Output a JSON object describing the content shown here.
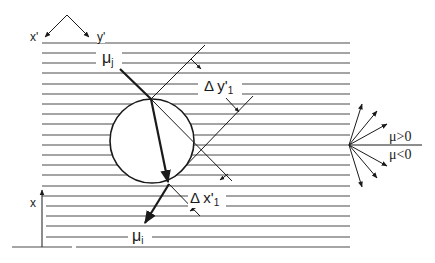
{
  "diagram": {
    "labels": {
      "axis_x_prime": "x'",
      "axis_y_prime": "y'",
      "axis_x": "x",
      "mu_j_main": "μ",
      "mu_j_sub": "j",
      "mu_i_main": "μ",
      "mu_i_sub": "i",
      "delta_y_main": "Δ y'",
      "delta_y_sub": "1",
      "delta_x_main": "Δ x'",
      "delta_x_sub": "1",
      "mu_positive": "μ>0",
      "mu_negative": "μ<0"
    },
    "colors": {
      "line": "#1a1a1a",
      "hatch": "#4a4a4a",
      "background": "#ffffff"
    },
    "geometry": {
      "hatch_lines_count": 21,
      "hatch_y_start": 43,
      "hatch_y_step": 10.2,
      "circle": {
        "cx": 152,
        "cy": 141,
        "r": 42
      },
      "incoming_ray": {
        "from": [
          120,
          69
        ],
        "to": [
          151,
          99
        ]
      },
      "through_ray": {
        "from": [
          151,
          99
        ],
        "to": [
          169,
          184
        ]
      },
      "outgoing_ray": {
        "from": [
          169,
          184
        ],
        "to": [
          144,
          225
        ]
      },
      "fan_origin": [
        349,
        145
      ],
      "fan_directions": 6
    }
  }
}
